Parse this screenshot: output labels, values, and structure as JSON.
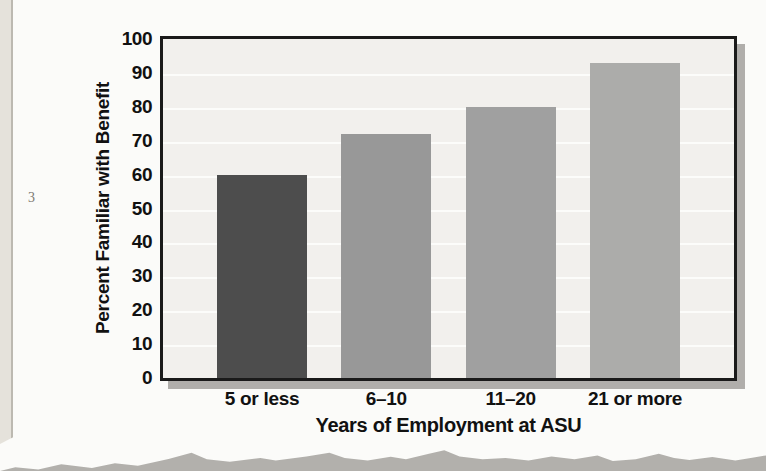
{
  "page": {
    "marginal_page_number": "3"
  },
  "palette": {
    "page_bg": "#fbfbf9",
    "strip_bg": "#e5e2db",
    "strip_edge": "#bcb9b1",
    "torn_bg": "#b2b0ac",
    "plot_bg": "#f2f0ed",
    "grid_color": "#fcfcfa",
    "frame_color": "#1a1a1a",
    "shadow_color": "#b0aeab"
  },
  "chart_data": {
    "type": "bar",
    "title": "",
    "xlabel": "Years of Employment at ASU",
    "ylabel": "Percent Familiar with Benefit",
    "categories": [
      "5 or less",
      "6–10",
      "11–20",
      "21 or more"
    ],
    "values": [
      60,
      72,
      80,
      93
    ],
    "bar_colors": [
      "#4d4d4d",
      "#989898",
      "#a0a0a0",
      "#acacaa"
    ],
    "ylim": [
      0,
      100
    ],
    "yticks": [
      0,
      10,
      20,
      30,
      40,
      50,
      60,
      70,
      80,
      90,
      100
    ],
    "grid": "horizontal",
    "legend_position": "none"
  }
}
